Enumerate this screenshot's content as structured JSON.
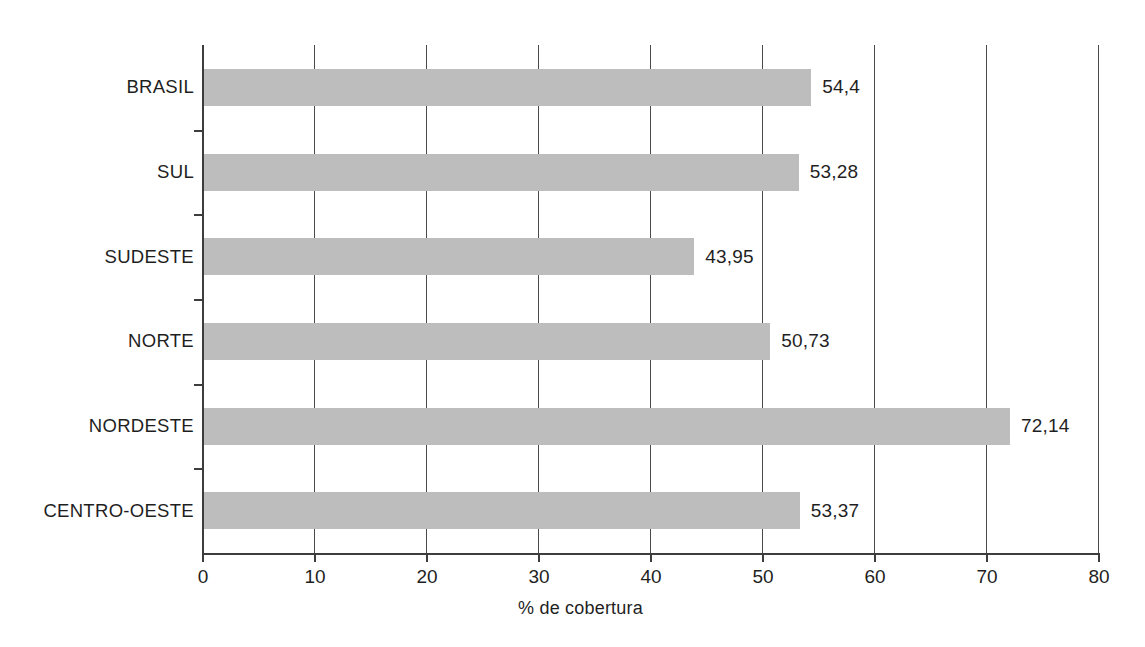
{
  "chart_data": {
    "type": "bar",
    "orientation": "horizontal",
    "title": "",
    "subtitle": "",
    "xlabel": "% de cobertura",
    "ylabel": "",
    "categories": [
      "BRASIL",
      "SUL",
      "SUDESTE",
      "NORTE",
      "NORDESTE",
      "CENTRO-OESTE"
    ],
    "values": [
      54.4,
      53.28,
      43.95,
      50.73,
      72.14,
      53.37
    ],
    "value_labels": [
      "54,4",
      "53,28",
      "43,95",
      "50,73",
      "72,14",
      "53,37"
    ],
    "xlim": [
      0,
      80
    ],
    "xticks": [
      0,
      10,
      20,
      30,
      40,
      50,
      60,
      70,
      80
    ],
    "xtick_labels": [
      "0",
      "10",
      "20",
      "30",
      "40",
      "50",
      "60",
      "70",
      "80"
    ],
    "grid": true,
    "grid_axis": "x",
    "legend": false,
    "bar_color": "#bdbdbd",
    "axis_color": "#3d3d3d",
    "text_color": "#1f1f1f",
    "background_color": "#ffffff"
  },
  "bars": [
    {
      "label": "BRASIL",
      "value": 54.4,
      "value_label": "54,4"
    },
    {
      "label": "SUL",
      "value": 53.28,
      "value_label": "53,28"
    },
    {
      "label": "SUDESTE",
      "value": 43.95,
      "value_label": "43,95"
    },
    {
      "label": "NORTE",
      "value": 50.73,
      "value_label": "50,73"
    },
    {
      "label": "NORDESTE",
      "value": 72.14,
      "value_label": "72,14"
    },
    {
      "label": "CENTRO-OESTE",
      "value": 53.37,
      "value_label": "53,37"
    }
  ],
  "axis": {
    "x_title": "% de cobertura",
    "ticks": [
      "0",
      "10",
      "20",
      "30",
      "40",
      "50",
      "60",
      "70",
      "80"
    ]
  }
}
